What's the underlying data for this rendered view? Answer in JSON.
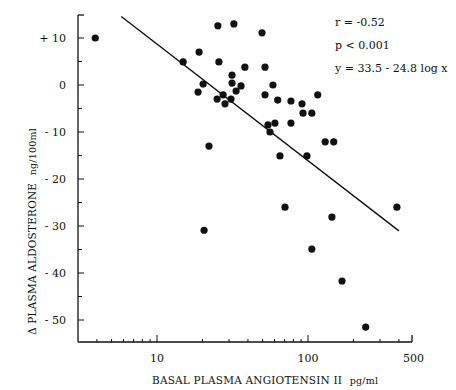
{
  "chart_data": {
    "type": "scatter",
    "title": "",
    "xlabel": "BASAL PLASMA ANGIOTENSIN II",
    "xlabel_unit": "pg/ml",
    "ylabel": "Δ PLASMA ALDOSTERONE",
    "ylabel_unit": "ng/100ml",
    "xscale": "log",
    "xlim": [
      3,
      500
    ],
    "ylim": [
      -54.7,
      15
    ],
    "x_ticks": [
      10,
      100,
      500
    ],
    "x_tick_labels": [
      "10",
      "100",
      "500"
    ],
    "y_ticks": [
      10,
      0,
      -10,
      -20,
      -30,
      -40,
      -50
    ],
    "y_tick_labels": [
      "+ 10",
      "0",
      "- 10",
      "- 20",
      "- 30",
      "- 40",
      "- 50"
    ],
    "grid": false,
    "legend": null,
    "annotations": [
      "r = -0.52",
      "p < 0.001",
      "y = 33.5 - 24.8 log x"
    ],
    "regression": {
      "intercept": 33.5,
      "slope": -24.8,
      "x_from": 5.8,
      "x_to": 400
    },
    "points": [
      {
        "x": 3.9,
        "y": 10.0
      },
      {
        "x": 14.9,
        "y": 4.9
      },
      {
        "x": 19.0,
        "y": 7.0
      },
      {
        "x": 25.3,
        "y": 12.6
      },
      {
        "x": 32.3,
        "y": 13.0
      },
      {
        "x": 49.6,
        "y": 11.1
      },
      {
        "x": 25.7,
        "y": 4.9
      },
      {
        "x": 38.2,
        "y": 3.8
      },
      {
        "x": 31.4,
        "y": 2.1
      },
      {
        "x": 31.4,
        "y": 0.4
      },
      {
        "x": 36.0,
        "y": -0.2
      },
      {
        "x": 33.4,
        "y": -1.3
      },
      {
        "x": 20.2,
        "y": 0.2
      },
      {
        "x": 18.7,
        "y": -1.5
      },
      {
        "x": 27.4,
        "y": -2.1
      },
      {
        "x": 25.0,
        "y": -3.0
      },
      {
        "x": 30.9,
        "y": -3.0
      },
      {
        "x": 28.2,
        "y": -4.0
      },
      {
        "x": 51.9,
        "y": 3.8
      },
      {
        "x": 58.6,
        "y": 0.0
      },
      {
        "x": 51.9,
        "y": -2.1
      },
      {
        "x": 63.0,
        "y": -3.2
      },
      {
        "x": 77.1,
        "y": -3.4
      },
      {
        "x": 91.3,
        "y": -4.0
      },
      {
        "x": 116,
        "y": -2.1
      },
      {
        "x": 92.7,
        "y": -6.0
      },
      {
        "x": 106,
        "y": -6.0
      },
      {
        "x": 54.3,
        "y": -8.5
      },
      {
        "x": 60.4,
        "y": -8.1
      },
      {
        "x": 77.1,
        "y": -8.1
      },
      {
        "x": 56.0,
        "y": -10.0
      },
      {
        "x": 130,
        "y": -12.1
      },
      {
        "x": 148,
        "y": -12.1
      },
      {
        "x": 65.2,
        "y": -15.1
      },
      {
        "x": 98.4,
        "y": -15.1
      },
      {
        "x": 22.1,
        "y": -13.0
      },
      {
        "x": 20.5,
        "y": -30.9
      },
      {
        "x": 70.4,
        "y": -26.0
      },
      {
        "x": 144,
        "y": -28.1
      },
      {
        "x": 106,
        "y": -34.9
      },
      {
        "x": 168,
        "y": -41.7
      },
      {
        "x": 241,
        "y": -51.5
      },
      {
        "x": 388,
        "y": -26.0
      }
    ]
  },
  "colors": {
    "ink": "#111111",
    "background": "#ffffff"
  }
}
